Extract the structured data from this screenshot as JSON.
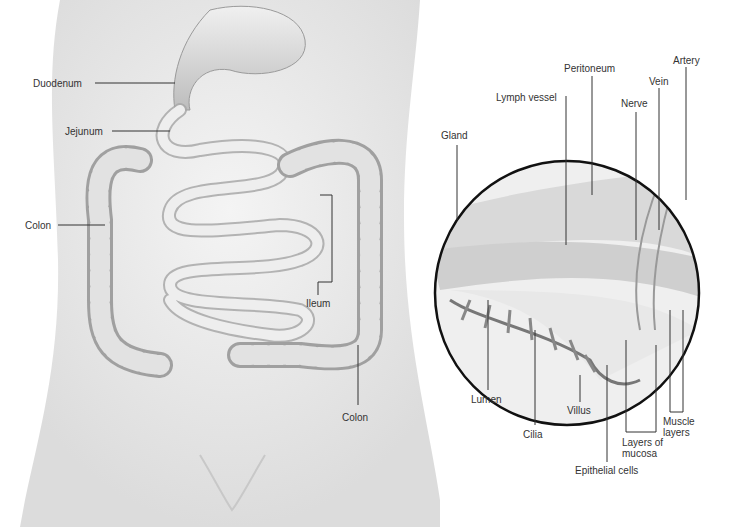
{
  "diagram": {
    "left_labels": {
      "duodenum": "Duodenum",
      "jejunum": "Jejunum",
      "colon_left": "Colon",
      "ileum": "Ileum",
      "colon_right": "Colon"
    },
    "inset_labels": {
      "gland": "Gland",
      "lymph_vessel": "Lymph vessel",
      "peritoneum": "Peritoneum",
      "nerve": "Nerve",
      "vein": "Vein",
      "artery": "Artery",
      "lumen": "Lumen",
      "cilia": "Cilia",
      "villus": "Villus",
      "epithelial_cells": "Epithelial cells",
      "layers_of_mucosa_1": "Layers of",
      "layers_of_mucosa_2": "mucosa",
      "muscle_layers_1": "Muscle",
      "muscle_layers_2": "layers"
    }
  }
}
